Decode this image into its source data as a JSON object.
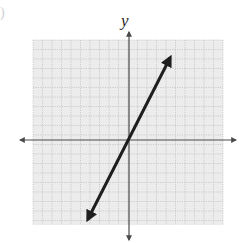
{
  "figure": {
    "type": "coordinate-plane-line-graph",
    "axis_labels": {
      "y": "y",
      "x": ""
    },
    "corner_mark": ")",
    "colors": {
      "background": "#ffffff",
      "grid_fill": "#ececec",
      "grid_lines": "#b5b5b5",
      "axes": "#4a4a4a",
      "line": "#1e1e1e"
    },
    "grid": {
      "left_px": 33,
      "top_px": 40,
      "right_px": 223,
      "bottom_px": 225,
      "cell_px": 9.5,
      "dashed": true
    },
    "axes": {
      "origin_px": [
        129,
        140
      ],
      "x_axis_px": {
        "from": 20,
        "to": 236
      },
      "y_axis_px": {
        "from": 32,
        "to": 240
      },
      "arrows_both_ends": true
    },
    "line": {
      "from_px": [
        88,
        219
      ],
      "to_px": [
        170,
        58
      ],
      "arrows_both_ends": true,
      "passes_through_origin": true,
      "approx_slope": 2
    }
  }
}
